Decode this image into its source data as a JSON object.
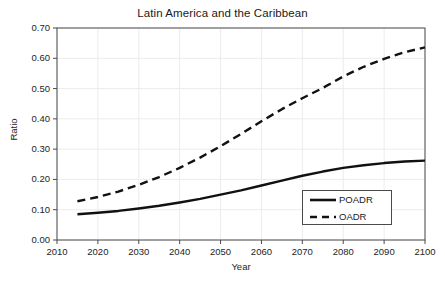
{
  "chart_data": {
    "type": "line",
    "title": "Latin America and the Caribbean",
    "xlabel": "Year",
    "ylabel": "Ratio",
    "xlim": [
      2010,
      2100
    ],
    "ylim": [
      0.0,
      0.7
    ],
    "grid": true,
    "legend_position": "bottom-right",
    "x_ticks": [
      "2010",
      "2020",
      "2030",
      "2040",
      "2050",
      "2060",
      "2070",
      "2080",
      "2090",
      "2100"
    ],
    "y_ticks": [
      "0.00",
      "0.10",
      "0.20",
      "0.30",
      "0.40",
      "0.50",
      "0.60",
      "0.70"
    ],
    "x": [
      2015,
      2020,
      2025,
      2030,
      2035,
      2040,
      2045,
      2050,
      2055,
      2060,
      2065,
      2070,
      2075,
      2080,
      2085,
      2090,
      2095,
      2100
    ],
    "series": [
      {
        "name": "POADR",
        "style": "solid",
        "color": "#111111",
        "values": [
          0.085,
          0.09,
          0.096,
          0.104,
          0.113,
          0.124,
          0.136,
          0.15,
          0.164,
          0.18,
          0.196,
          0.212,
          0.226,
          0.238,
          0.247,
          0.254,
          0.259,
          0.262
        ]
      },
      {
        "name": "OADR",
        "style": "dashed",
        "color": "#111111",
        "values": [
          0.128,
          0.142,
          0.16,
          0.182,
          0.208,
          0.238,
          0.272,
          0.31,
          0.35,
          0.392,
          0.432,
          0.468,
          0.502,
          0.54,
          0.572,
          0.598,
          0.62,
          0.636
        ]
      }
    ]
  },
  "legend": {
    "items": [
      {
        "label": "POADR",
        "style": "solid"
      },
      {
        "label": "OADR",
        "style": "dashed"
      }
    ]
  }
}
